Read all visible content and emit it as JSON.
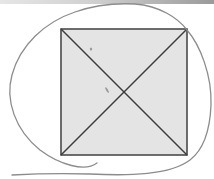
{
  "figure": {
    "width": 214,
    "height": 179,
    "colors": {
      "background": "#ffffff",
      "square_fill": "#e4e4e4",
      "square_stroke": "#4a4a4a",
      "diagonal_stroke": "#3a3a3a",
      "loop_stroke": "#8c8c8c",
      "smudge": "#7a7a7a",
      "top_band_light": "#e6e6e6",
      "top_band_dark": "#9a9a9a"
    },
    "square": {
      "x": 61,
      "y": 29,
      "width": 126,
      "height": 126
    },
    "diagonals": [
      {
        "x1": 61,
        "y1": 29,
        "x2": 187,
        "y2": 155
      },
      {
        "x1": 187,
        "y1": 29,
        "x2": 61,
        "y2": 155
      }
    ],
    "intersection": {
      "x": 124,
      "y": 92
    },
    "loop_path": "M 97 163 C 85 172, 60 165, 40 150 C 15 130, 5 100, 12 75 C 20 45, 45 22, 75 12 C 95 5, 115 3, 135 4 C 160 6, 178 18, 187 30 C 200 45, 212 75, 211 105 C 210 130, 203 150, 190 160 C 170 175, 130 176, 90 174 C 60 173, 30 174, 12 175",
    "smudges": [
      {
        "x": 91,
        "y": 49,
        "rx": 1.2,
        "ry": 1.6
      },
      {
        "x": 107,
        "y": 90,
        "rx": 1.0,
        "ry": 3.2,
        "rotate": -30
      }
    ]
  }
}
